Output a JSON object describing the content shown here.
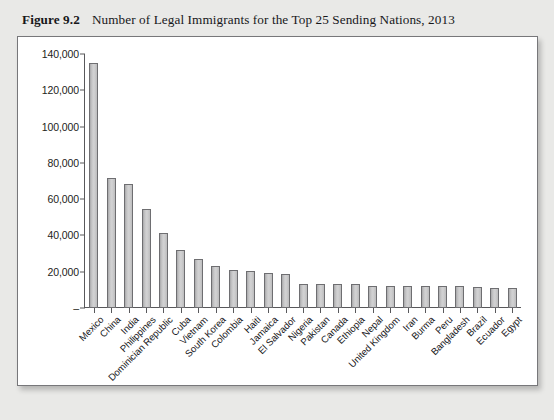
{
  "caption": {
    "figure_label": "Figure 9.2",
    "title": "Number of Legal Immigrants for the Top 25 Sending Nations, 2013"
  },
  "chart_data": {
    "type": "bar",
    "title": "Number of Legal Immigrants for the Top 25 Sending Nations, 2013",
    "xlabel": "",
    "ylabel": "",
    "ylim": [
      0,
      140000
    ],
    "grid": false,
    "legend": "none",
    "ytick_labels": [
      "140,000",
      "120,000",
      "100,000",
      "80,000",
      "60,000",
      "40,000",
      "20,000",
      "–"
    ],
    "ytick_values": [
      140000,
      120000,
      100000,
      80000,
      60000,
      40000,
      20000,
      0
    ],
    "categories": [
      "Mexico",
      "China",
      "India",
      "Philippines",
      "Dominician Republic",
      "Cuba",
      "Vietnam",
      "South Korea",
      "Colombia",
      "Haiti",
      "Jamaica",
      "El Salvador",
      "Nigeria",
      "Pakistan",
      "Canada",
      "Ethiopia",
      "Nepal",
      "United Kingdom",
      "Iran",
      "Burma",
      "Peru",
      "Bangladesh",
      "Brazil",
      "Ecuador",
      "Egypt"
    ],
    "values": [
      135000,
      71500,
      68500,
      54500,
      41500,
      32000,
      27000,
      23000,
      21000,
      20500,
      19500,
      18500,
      13500,
      13500,
      13000,
      13000,
      12000,
      12000,
      12000,
      12000,
      12000,
      12000,
      11500,
      11000,
      11000
    ],
    "bar_fill": "#cccccd",
    "bar_edge": "#6e6e71",
    "axis_color": "#58585b",
    "panel_background": "#ffffff",
    "page_background": "#e9e9e7"
  }
}
